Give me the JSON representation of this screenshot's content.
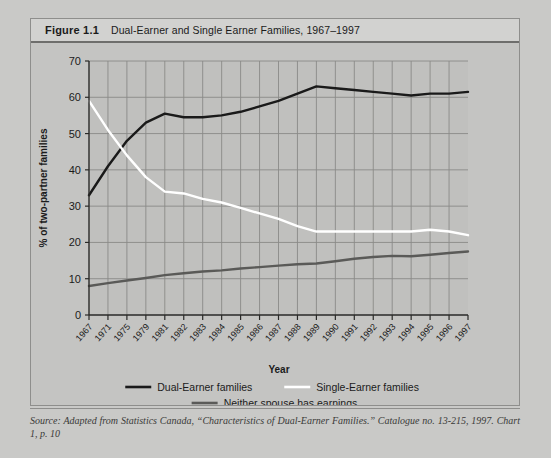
{
  "figure": {
    "number": "Figure 1.1",
    "title": "Dual-Earner and Single Earner Families, 1967–1997"
  },
  "source": {
    "text": "Source: Adapted from Statistics Canada, “Characteristics of Dual-Earner Families.” Catalogue no. 13-215, 1997. Chart 1, p. 10"
  },
  "colors": {
    "page_background": "#c9c9c7",
    "figure_background": "#c4c4c2",
    "header_background": "#d2d2d0",
    "plot_background": "#c0c0be",
    "grid": "#8a8a88",
    "axis": "#2a2a28",
    "dual_earner": "#1a1a1a",
    "single_earner": "#ffffff",
    "neither_spouse": "#5a5a58",
    "text": "#1b1b1b"
  },
  "chart_data": {
    "type": "line",
    "title": "Dual-Earner and Single Earner Families, 1967–1997",
    "xlabel": "Year",
    "ylabel": "% of two-partner families",
    "ylim": [
      0,
      70
    ],
    "yticks": [
      0,
      10,
      20,
      30,
      40,
      50,
      60,
      70
    ],
    "grid": true,
    "legend_position": "bottom",
    "categories": [
      "1967",
      "1971",
      "1975",
      "1979",
      "1981",
      "1982",
      "1983",
      "1984",
      "1985",
      "1986",
      "1987",
      "1988",
      "1989",
      "1990",
      "1991",
      "1992",
      "1993",
      "1994",
      "1995",
      "1996",
      "1997"
    ],
    "series": [
      {
        "name": "Dual-Earner families",
        "color": "#1a1a1a",
        "values": [
          33,
          41,
          48,
          53,
          55.5,
          54.5,
          54.5,
          55,
          56,
          57.5,
          59,
          61,
          63,
          62.5,
          62,
          61.5,
          61,
          60.5,
          61,
          61,
          61.5
        ]
      },
      {
        "name": "Single-Earner families",
        "color": "#ffffff",
        "values": [
          59,
          51,
          44,
          38,
          34,
          33.5,
          32,
          31,
          29.5,
          28,
          26.5,
          24.5,
          23,
          23,
          23,
          23,
          23,
          23,
          23.5,
          23,
          22
        ]
      },
      {
        "name": "Neither spouse has earnings",
        "color": "#5a5a58",
        "values": [
          8,
          8.8,
          9.5,
          10.2,
          11,
          11.5,
          12,
          12.3,
          12.8,
          13.2,
          13.6,
          14,
          14.2,
          14.8,
          15.5,
          16,
          16.3,
          16.2,
          16.6,
          17.1,
          17.5
        ]
      }
    ]
  },
  "legend": [
    {
      "label": "Dual-Earner families",
      "color": "#1a1a1a"
    },
    {
      "label": "Single-Earner families",
      "color": "#ffffff"
    },
    {
      "label": "Neither spouse has earnings",
      "color": "#5a5a58"
    }
  ]
}
